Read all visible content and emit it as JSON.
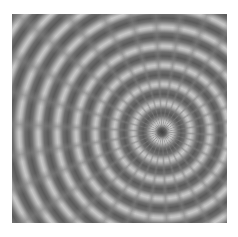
{
  "image": {
    "description": "grayscale concentric ripple / reaction-diffusion texture",
    "colors": {
      "dark": "#5a5a5a",
      "mid": "#8a8a8a",
      "light": "#c8c8c8",
      "background": "#ffffff"
    }
  }
}
